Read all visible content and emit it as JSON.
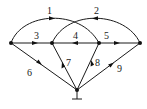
{
  "diagram": {
    "type": "directed-graph",
    "nodes": [
      {
        "id": "left",
        "x": 11,
        "y": 43
      },
      {
        "id": "mid-left",
        "x": 52,
        "y": 43
      },
      {
        "id": "mid-right",
        "x": 99,
        "y": 43
      },
      {
        "id": "right",
        "x": 140,
        "y": 43
      },
      {
        "id": "bottom",
        "x": 77,
        "y": 90,
        "grounded": true
      }
    ],
    "edges": [
      {
        "label": "1",
        "from": "left",
        "to": "mid-right",
        "shape": "arc",
        "arrow_direction": "right"
      },
      {
        "label": "2",
        "from": "right",
        "to": "mid-left",
        "shape": "arc",
        "arrow_direction": "left"
      },
      {
        "label": "3",
        "from": "left",
        "to": "mid-left",
        "shape": "line",
        "arrow_direction": "right"
      },
      {
        "label": "4",
        "from": "mid-right",
        "to": "mid-left",
        "shape": "line",
        "arrow_direction": "left"
      },
      {
        "label": "5",
        "from": "mid-right",
        "to": "right",
        "shape": "line",
        "arrow_direction": "right"
      },
      {
        "label": "6",
        "from": "left",
        "to": "bottom",
        "shape": "line",
        "arrow_direction": "down-right"
      },
      {
        "label": "7",
        "from": "bottom",
        "to": "mid-left",
        "shape": "line",
        "arrow_direction": "up"
      },
      {
        "label": "8",
        "from": "mid-right",
        "to": "bottom",
        "shape": "line",
        "arrow_direction": "down"
      },
      {
        "label": "9",
        "from": "bottom",
        "to": "right",
        "shape": "line",
        "arrow_direction": "up-right"
      }
    ]
  }
}
